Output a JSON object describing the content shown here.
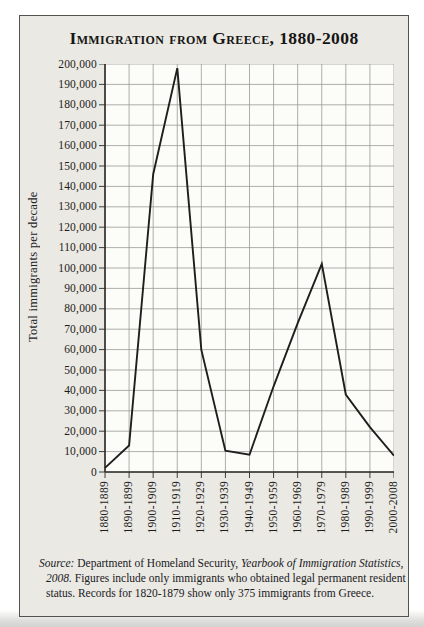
{
  "figure": {
    "source_note": {
      "label": "Source:",
      "part1": " Department of Homeland Security, ",
      "part2": "Yearbook of Immigration Statistics, 2008.",
      "part3": " Figures include only immigrants who obtained legal permanent resident status. Records for 1820-1879 show only 375 immigrants from Greece."
    }
  },
  "chart_data": {
    "type": "line",
    "title": "Immigration from Greece, 1880-2008",
    "categories": [
      "1880-1889",
      "1890-1899",
      "1900-1909",
      "1910-1919",
      "1920-1929",
      "1930-1939",
      "1940-1949",
      "1950-1959",
      "1960-1969",
      "1970-1979",
      "1980-1989",
      "1990-1999",
      "2000-2008"
    ],
    "values": [
      2000,
      13000,
      146000,
      198000,
      60000,
      10500,
      8500,
      42000,
      73000,
      102000,
      38000,
      22000,
      8000
    ],
    "xlabel": "",
    "ylabel": "Total immigrants per decade",
    "ylim": [
      0,
      200000
    ],
    "y_tick_step": 10000,
    "y_ticks": [
      "200,000",
      "190,000",
      "180,000",
      "170,000",
      "160,000",
      "150,000",
      "140,000",
      "130,000",
      "120,000",
      "110,000",
      "100,000",
      "90,000",
      "80,000",
      "70,000",
      "60,000",
      "50,000",
      "40,000",
      "30,000",
      "20,000",
      "10,000",
      "0"
    ],
    "grid": true,
    "legend": "none",
    "line_color": "#1e1e1c",
    "grid_color": "#9a9a96",
    "axis_color": "#2b2b27",
    "plot_bg": "#fcfcf9",
    "figure_bg": "#ebe9e4"
  }
}
